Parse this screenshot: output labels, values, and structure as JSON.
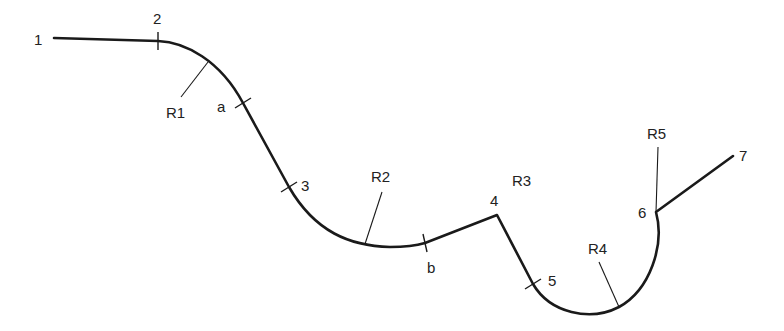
{
  "diagram": {
    "type": "profile-path",
    "points": [
      {
        "id": "p1",
        "label": "1",
        "x": 54,
        "y": 38,
        "label_x": 34,
        "label_y": 45
      },
      {
        "id": "p2",
        "label": "2",
        "x": 158,
        "y": 41,
        "label_x": 153,
        "label_y": 24
      },
      {
        "id": "pa",
        "label": "a",
        "x": 243,
        "y": 103,
        "label_x": 217,
        "label_y": 112
      },
      {
        "id": "p3",
        "label": "3",
        "x": 289,
        "y": 187,
        "label_x": 301,
        "label_y": 191
      },
      {
        "id": "pb",
        "label": "b",
        "x": 425,
        "y": 243,
        "label_x": 427,
        "label_y": 273
      },
      {
        "id": "p4",
        "label": "4",
        "x": 497,
        "y": 215,
        "label_x": 490,
        "label_y": 206
      },
      {
        "id": "p5",
        "label": "5",
        "x": 533,
        "y": 284,
        "label_x": 548,
        "label_y": 286
      },
      {
        "id": "p6",
        "label": "6",
        "x": 656,
        "y": 212,
        "label_x": 638,
        "label_y": 218
      },
      {
        "id": "p7",
        "label": "7",
        "x": 733,
        "y": 156,
        "label_x": 739,
        "label_y": 161
      }
    ],
    "radii": [
      {
        "id": "r1",
        "label": "R1",
        "label_x": 166,
        "label_y": 118,
        "leader": [
          208,
          62,
          181,
          97
        ]
      },
      {
        "id": "r2",
        "label": "R2",
        "label_x": 371,
        "label_y": 182,
        "leader": [
          365,
          244,
          382,
          192
        ]
      },
      {
        "id": "r3",
        "label": "R3",
        "label_x": 512,
        "label_y": 186,
        "leader": null
      },
      {
        "id": "r4",
        "label": "R4",
        "label_x": 588,
        "label_y": 254,
        "leader": [
          619,
          307,
          599,
          262
        ]
      },
      {
        "id": "r5",
        "label": "R5",
        "label_x": 647,
        "label_y": 139,
        "leader": [
          656,
          212,
          658,
          147
        ]
      }
    ],
    "stroke_color": "#1a1a1a",
    "background": "#ffffff"
  }
}
